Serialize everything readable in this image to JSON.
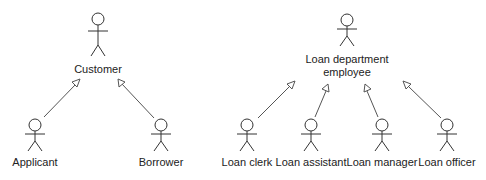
{
  "diagram": {
    "type": "uml-use-case-actor-generalization",
    "groups": [
      {
        "parent": {
          "id": "customer",
          "label_lines": [
            "Customer"
          ]
        },
        "children": [
          {
            "id": "applicant",
            "label_lines": [
              "Applicant"
            ]
          },
          {
            "id": "borrower",
            "label_lines": [
              "Borrower"
            ]
          }
        ]
      },
      {
        "parent": {
          "id": "loan-department-employee",
          "label_lines": [
            "Loan department",
            "employee"
          ]
        },
        "children": [
          {
            "id": "loan-clerk",
            "label_lines": [
              "Loan clerk"
            ]
          },
          {
            "id": "loan-assistant",
            "label_lines": [
              "Loan assistant"
            ]
          },
          {
            "id": "loan-manager",
            "label_lines": [
              "Loan manager"
            ]
          },
          {
            "id": "loan-officer",
            "label_lines": [
              "Loan officer"
            ]
          }
        ]
      }
    ],
    "relationship": "generalization (hollow triangle arrow from child to parent)"
  },
  "actors": {
    "customer": {
      "label": "Customer"
    },
    "applicant": {
      "label": "Applicant"
    },
    "borrower": {
      "label": "Borrower"
    },
    "loan_department_employee": {
      "line1": "Loan department",
      "line2": "employee"
    },
    "loan_clerk": {
      "label": "Loan clerk"
    },
    "loan_assistant": {
      "label": "Loan assistant"
    },
    "loan_manager": {
      "label": "Loan manager"
    },
    "loan_officer": {
      "label": "Loan officer"
    }
  },
  "colors": {
    "line": "#333333",
    "arrow": "#555555",
    "text": "#222222",
    "background": "#ffffff"
  }
}
